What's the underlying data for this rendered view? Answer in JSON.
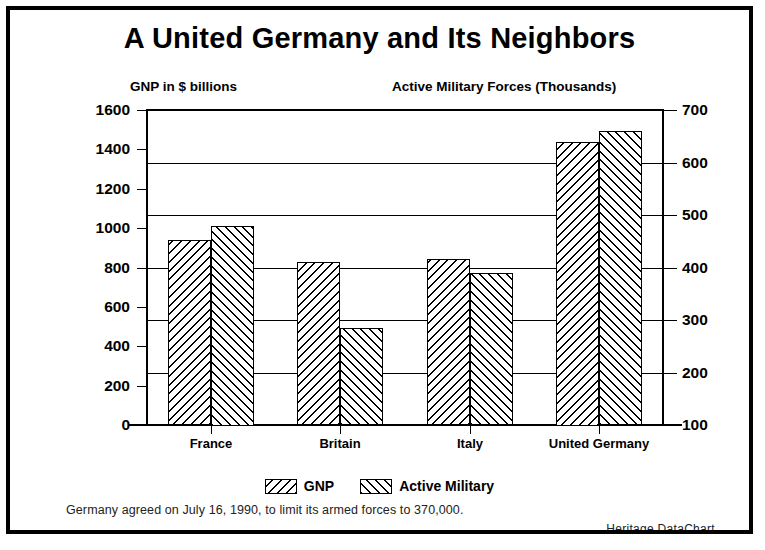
{
  "chart_data": {
    "type": "bar",
    "title": "A United Germany and Its Neighbors",
    "categories": [
      "France",
      "Britain",
      "Italy",
      "United Germany"
    ],
    "series": [
      {
        "name": "GNP",
        "axis": "left",
        "unit": "$ billions",
        "hatch": "backslash",
        "values": [
          940,
          830,
          845,
          1440
        ]
      },
      {
        "name": "Active Military",
        "axis": "right",
        "unit": "thousands",
        "hatch": "forwardslash",
        "values": [
          480,
          285,
          390,
          660
        ]
      }
    ],
    "left_axis": {
      "caption": "GNP in $ billions",
      "ticks": [
        0,
        200,
        400,
        600,
        800,
        1000,
        1200,
        1400,
        1600
      ],
      "ylim": [
        0,
        1600
      ]
    },
    "right_axis": {
      "caption": "Active Military Forces (Thousands)",
      "ticks": [
        100,
        200,
        300,
        400,
        500,
        600,
        700
      ],
      "ylim": [
        100,
        700
      ]
    },
    "grid": "horizontal gridlines aligned to right axis ticks",
    "legend": [
      "GNP",
      "Active Military"
    ],
    "legend_position": "bottom-center",
    "footnote": "Germany agreed on July 16, 1990, to limit its armed forces to 370,000.",
    "source": "Heritage DataChart",
    "colors": {
      "ink": "#000000",
      "background": "#ffffff"
    }
  }
}
